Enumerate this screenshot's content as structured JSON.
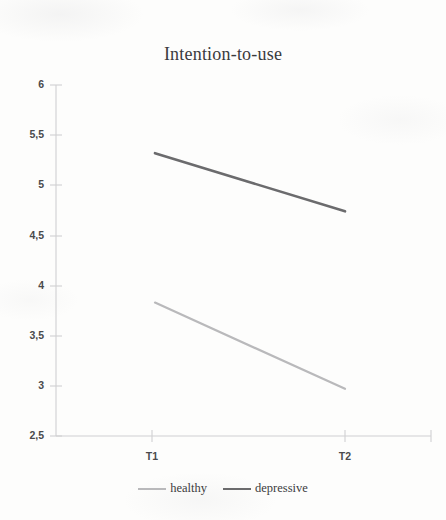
{
  "chart_data": {
    "type": "line",
    "title": "Intention-to-use",
    "xlabel": "",
    "ylabel": "",
    "categories": [
      "T1",
      "T2"
    ],
    "x": [
      0,
      1
    ],
    "ylim": [
      2.5,
      6
    ],
    "yticks": [
      6,
      5.5,
      5,
      4.5,
      4,
      3.5,
      3,
      2.5
    ],
    "ytick_labels": [
      "6",
      "5,5",
      "5",
      "4,5",
      "4",
      "3,5",
      "3",
      "2,5"
    ],
    "grid": false,
    "legend_position": "bottom",
    "decimal_separator": ",",
    "series": [
      {
        "name": "healthy",
        "values": [
          3.83,
          2.97
        ],
        "color": "#b9b9bb",
        "line_width": 2.2
      },
      {
        "name": "depressive",
        "values": [
          5.32,
          4.74
        ],
        "color": "#6b6b6d",
        "line_width": 2.6
      }
    ],
    "axis_color": "#cfcfd2",
    "tick_label_color": "#4a4a4c",
    "title_color": "#3a3a3c",
    "background_color": "#fdfdfc"
  }
}
